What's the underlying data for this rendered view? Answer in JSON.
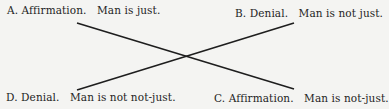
{
  "diagram": {
    "type": "square-of-opposition-cross",
    "corners": {
      "top_left": {
        "letter": "A.",
        "kind": "Affirmation.",
        "proposition": "Man is just."
      },
      "top_right": {
        "letter": "B.",
        "kind": "Denial.",
        "proposition": "Man is not just."
      },
      "bottom_left": {
        "letter": "D.",
        "kind": "Denial.",
        "proposition": "Man is not not-just."
      },
      "bottom_right": {
        "letter": "C.",
        "kind": "Affirmation.",
        "proposition": "Man is not-just."
      }
    },
    "connections": [
      {
        "from": "top_left",
        "to": "bottom_right"
      },
      {
        "from": "top_right",
        "to": "bottom_left"
      }
    ],
    "line_color": "#1e1e1e"
  }
}
